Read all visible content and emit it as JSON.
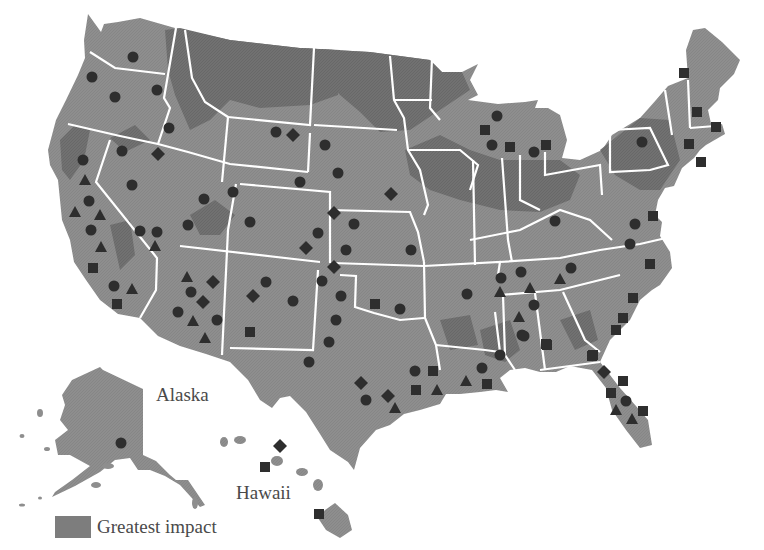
{
  "map": {
    "title": "United States map with impact regions and site markers",
    "labels": {
      "alaska": "Alaska",
      "hawaii": "Hawaii"
    },
    "legend": {
      "swatch_color": "#7d7d7d",
      "label": "Greatest impact"
    },
    "colors": {
      "land": "#8e8e8e",
      "greatest_impact": "#6e6e6e",
      "borders": "#ffffff",
      "markers": "#2e2e2e",
      "background": "#ffffff"
    },
    "marker_types": [
      "circle",
      "triangle",
      "square",
      "diamond"
    ],
    "markers": [
      {
        "type": "circle",
        "x": 133,
        "y": 57
      },
      {
        "type": "circle",
        "x": 92,
        "y": 77
      },
      {
        "type": "circle",
        "x": 115,
        "y": 97
      },
      {
        "type": "circle",
        "x": 157,
        "y": 90
      },
      {
        "type": "circle",
        "x": 169,
        "y": 128
      },
      {
        "type": "circle",
        "x": 122,
        "y": 151
      },
      {
        "type": "diamond",
        "x": 158,
        "y": 154
      },
      {
        "type": "circle",
        "x": 83,
        "y": 160
      },
      {
        "type": "triangle",
        "x": 85,
        "y": 180
      },
      {
        "type": "circle",
        "x": 89,
        "y": 201
      },
      {
        "type": "triangle",
        "x": 75,
        "y": 212
      },
      {
        "type": "triangle",
        "x": 100,
        "y": 215
      },
      {
        "type": "circle",
        "x": 91,
        "y": 230
      },
      {
        "type": "triangle",
        "x": 101,
        "y": 247
      },
      {
        "type": "square",
        "x": 93,
        "y": 268
      },
      {
        "type": "circle",
        "x": 114,
        "y": 286
      },
      {
        "type": "triangle",
        "x": 132,
        "y": 289
      },
      {
        "type": "square",
        "x": 117,
        "y": 304
      },
      {
        "type": "circle",
        "x": 132,
        "y": 185
      },
      {
        "type": "circle",
        "x": 140,
        "y": 231
      },
      {
        "type": "circle",
        "x": 157,
        "y": 232
      },
      {
        "type": "triangle",
        "x": 155,
        "y": 246
      },
      {
        "type": "circle",
        "x": 188,
        "y": 225
      },
      {
        "type": "circle",
        "x": 204,
        "y": 199
      },
      {
        "type": "circle",
        "x": 233,
        "y": 192
      },
      {
        "type": "circle",
        "x": 276,
        "y": 132
      },
      {
        "type": "diamond",
        "x": 293,
        "y": 135
      },
      {
        "type": "circle",
        "x": 300,
        "y": 182
      },
      {
        "type": "circle",
        "x": 325,
        "y": 145
      },
      {
        "type": "circle",
        "x": 250,
        "y": 222
      },
      {
        "type": "circle",
        "x": 318,
        "y": 233
      },
      {
        "type": "diamond",
        "x": 306,
        "y": 248
      },
      {
        "type": "diamond",
        "x": 391,
        "y": 194
      },
      {
        "type": "circle",
        "x": 338,
        "y": 173
      },
      {
        "type": "diamond",
        "x": 334,
        "y": 213
      },
      {
        "type": "circle",
        "x": 354,
        "y": 224
      },
      {
        "type": "circle",
        "x": 346,
        "y": 250
      },
      {
        "type": "circle",
        "x": 411,
        "y": 250
      },
      {
        "type": "diamond",
        "x": 334,
        "y": 267
      },
      {
        "type": "triangle",
        "x": 187,
        "y": 277
      },
      {
        "type": "diamond",
        "x": 213,
        "y": 282
      },
      {
        "type": "circle",
        "x": 191,
        "y": 292
      },
      {
        "type": "diamond",
        "x": 203,
        "y": 302
      },
      {
        "type": "circle",
        "x": 178,
        "y": 312
      },
      {
        "type": "triangle",
        "x": 193,
        "y": 321
      },
      {
        "type": "circle",
        "x": 217,
        "y": 320
      },
      {
        "type": "triangle",
        "x": 205,
        "y": 338
      },
      {
        "type": "circle",
        "x": 266,
        "y": 282
      },
      {
        "type": "diamond",
        "x": 253,
        "y": 296
      },
      {
        "type": "circle",
        "x": 293,
        "y": 301
      },
      {
        "type": "square",
        "x": 250,
        "y": 332
      },
      {
        "type": "circle",
        "x": 322,
        "y": 281
      },
      {
        "type": "circle",
        "x": 341,
        "y": 296
      },
      {
        "type": "circle",
        "x": 336,
        "y": 320
      },
      {
        "type": "circle",
        "x": 329,
        "y": 342
      },
      {
        "type": "circle",
        "x": 309,
        "y": 362
      },
      {
        "type": "square",
        "x": 375,
        "y": 304
      },
      {
        "type": "circle",
        "x": 400,
        "y": 309
      },
      {
        "type": "diamond",
        "x": 361,
        "y": 383
      },
      {
        "type": "circle",
        "x": 366,
        "y": 400
      },
      {
        "type": "diamond",
        "x": 388,
        "y": 396
      },
      {
        "type": "triangle",
        "x": 395,
        "y": 408
      },
      {
        "type": "circle",
        "x": 415,
        "y": 371
      },
      {
        "type": "square",
        "x": 433,
        "y": 371
      },
      {
        "type": "square",
        "x": 416,
        "y": 390
      },
      {
        "type": "triangle",
        "x": 437,
        "y": 390
      },
      {
        "type": "triangle",
        "x": 466,
        "y": 381
      },
      {
        "type": "circle",
        "x": 482,
        "y": 368
      },
      {
        "type": "square",
        "x": 487,
        "y": 384
      },
      {
        "type": "circle",
        "x": 500,
        "y": 355
      },
      {
        "type": "circle",
        "x": 522,
        "y": 335
      },
      {
        "type": "square",
        "x": 546,
        "y": 344
      },
      {
        "type": "square",
        "x": 592,
        "y": 356
      },
      {
        "type": "diamond",
        "x": 604,
        "y": 372
      },
      {
        "type": "square",
        "x": 623,
        "y": 381
      },
      {
        "type": "square",
        "x": 611,
        "y": 393
      },
      {
        "type": "circle",
        "x": 626,
        "y": 401
      },
      {
        "type": "square",
        "x": 643,
        "y": 411
      },
      {
        "type": "triangle",
        "x": 616,
        "y": 410
      },
      {
        "type": "triangle",
        "x": 632,
        "y": 419
      },
      {
        "type": "circle",
        "x": 467,
        "y": 294
      },
      {
        "type": "circle",
        "x": 501,
        "y": 278
      },
      {
        "type": "triangle",
        "x": 500,
        "y": 292
      },
      {
        "type": "circle",
        "x": 521,
        "y": 272
      },
      {
        "type": "triangle",
        "x": 530,
        "y": 288
      },
      {
        "type": "circle",
        "x": 534,
        "y": 305
      },
      {
        "type": "triangle",
        "x": 519,
        "y": 317
      },
      {
        "type": "circle",
        "x": 524,
        "y": 336
      },
      {
        "type": "square",
        "x": 547,
        "y": 345
      },
      {
        "type": "circle",
        "x": 571,
        "y": 268
      },
      {
        "type": "triangle",
        "x": 560,
        "y": 279
      },
      {
        "type": "circle",
        "x": 555,
        "y": 221
      },
      {
        "type": "circle",
        "x": 635,
        "y": 224
      },
      {
        "type": "square",
        "x": 653,
        "y": 216
      },
      {
        "type": "circle",
        "x": 630,
        "y": 244
      },
      {
        "type": "square",
        "x": 650,
        "y": 264
      },
      {
        "type": "square",
        "x": 633,
        "y": 298
      },
      {
        "type": "square",
        "x": 623,
        "y": 318
      },
      {
        "type": "square",
        "x": 616,
        "y": 330
      },
      {
        "type": "square",
        "x": 593,
        "y": 355
      },
      {
        "type": "circle",
        "x": 497,
        "y": 116
      },
      {
        "type": "square",
        "x": 485,
        "y": 130
      },
      {
        "type": "circle",
        "x": 492,
        "y": 145
      },
      {
        "type": "square",
        "x": 510,
        "y": 147
      },
      {
        "type": "square",
        "x": 546,
        "y": 145
      },
      {
        "type": "circle",
        "x": 534,
        "y": 152
      },
      {
        "type": "circle",
        "x": 642,
        "y": 142
      },
      {
        "type": "square",
        "x": 684,
        "y": 73
      },
      {
        "type": "square",
        "x": 697,
        "y": 112
      },
      {
        "type": "square",
        "x": 716,
        "y": 127
      },
      {
        "type": "square",
        "x": 689,
        "y": 144
      },
      {
        "type": "square",
        "x": 701,
        "y": 162
      },
      {
        "type": "circle",
        "x": 121,
        "y": 443
      },
      {
        "type": "diamond",
        "x": 280,
        "y": 446
      },
      {
        "type": "square",
        "x": 265,
        "y": 467
      },
      {
        "type": "square",
        "x": 319,
        "y": 514
      }
    ]
  }
}
